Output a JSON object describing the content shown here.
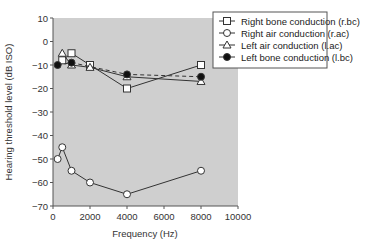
{
  "chart_data": {
    "type": "line",
    "title": "",
    "xlabel": "Frequency (Hz)",
    "ylabel": "Hearing threshold level (dB ISO)",
    "xlim": [
      0,
      10000
    ],
    "ylim": [
      -70,
      10
    ],
    "xticks": [
      0,
      2000,
      4000,
      6000,
      8000,
      10000
    ],
    "yticks": [
      10,
      0,
      -10,
      -20,
      -30,
      -40,
      -50,
      -60,
      -70
    ],
    "grid": false,
    "background": "#cfcfcf",
    "legend_position": "upper right (outside plot)",
    "series": [
      {
        "name": "Right bone conduction (r.bc)",
        "marker": "open-square",
        "line": "solid",
        "x": [
          500,
          1000,
          2000,
          4000,
          8000
        ],
        "values": [
          -8,
          -5,
          -10,
          -20,
          -10
        ]
      },
      {
        "name": "Right air conduction (r.ac)",
        "marker": "open-circle",
        "line": "solid",
        "x": [
          250,
          500,
          1000,
          2000,
          4000,
          8000
        ],
        "values": [
          -50,
          -45,
          -55,
          -60,
          -65,
          -55
        ]
      },
      {
        "name": "Left air conduction (l.ac)",
        "marker": "open-triangle",
        "line": "solid",
        "x": [
          500,
          1000,
          2000,
          4000,
          8000
        ],
        "values": [
          -5,
          -10,
          -11,
          -15,
          -17
        ]
      },
      {
        "name": "Left bone conduction (l.bc)",
        "marker": "filled-circle",
        "line": "dashed",
        "x": [
          250,
          1000,
          4000,
          8000
        ],
        "values": [
          -10,
          -9,
          -14,
          -15
        ]
      }
    ]
  },
  "legend": {
    "items": [
      {
        "label": "Right bone conduction (r.bc)"
      },
      {
        "label": "Right air conduction (r.ac)"
      },
      {
        "label": "Left air conduction (l.ac)"
      },
      {
        "label": "Left bone conduction (l.bc)"
      }
    ]
  },
  "axes": {
    "x_title": "Frequency (Hz)",
    "y_title": "Hearing threshold level (dB ISO)",
    "x_tick_labels": [
      "0",
      "2000",
      "4000",
      "6000",
      "8000",
      "10000"
    ],
    "y_tick_labels": [
      "10",
      "0",
      "−10",
      "−20",
      "−30",
      "−40",
      "−50",
      "−60",
      "−70"
    ]
  }
}
